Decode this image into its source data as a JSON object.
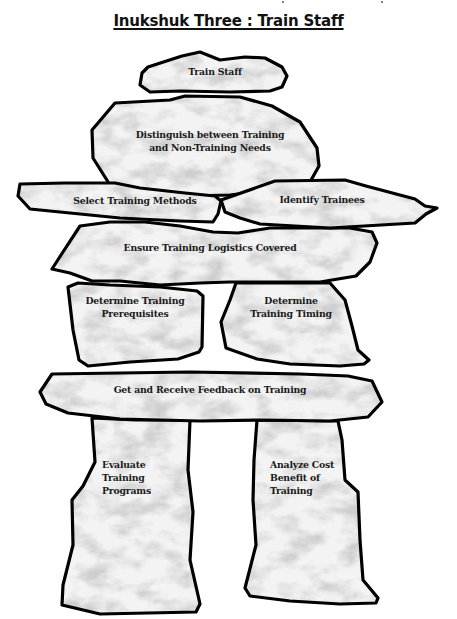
{
  "title": "Inukshuk Three : Train Staff",
  "colors": {
    "outline": "#000000",
    "stone_fill": "#ececec",
    "background": "#ffffff",
    "text": "#1a1a1a"
  },
  "stones": [
    {
      "id": "head",
      "label": "Train Staff"
    },
    {
      "id": "neck",
      "label_line1": "Distinguish between Training",
      "label_line2": "and Non-Training Needs"
    },
    {
      "id": "left-arm",
      "label": "Select Training Methods"
    },
    {
      "id": "right-arm",
      "label": "Identify Trainees"
    },
    {
      "id": "shoulders",
      "label": "Ensure Training Logistics Covered"
    },
    {
      "id": "left-torso",
      "label_line1": "Determine Training",
      "label_line2": "Prerequisites"
    },
    {
      "id": "right-torso",
      "label_line1": "Determine",
      "label_line2": "Training Timing"
    },
    {
      "id": "hips",
      "label": "Get and Receive Feedback on Training"
    },
    {
      "id": "left-leg",
      "label_line1": "Evaluate",
      "label_line2": "Training",
      "label_line3": "Programs"
    },
    {
      "id": "right-leg",
      "label_line1": "Analyze Cost",
      "label_line2": "Benefit of",
      "label_line3": "Training"
    }
  ]
}
